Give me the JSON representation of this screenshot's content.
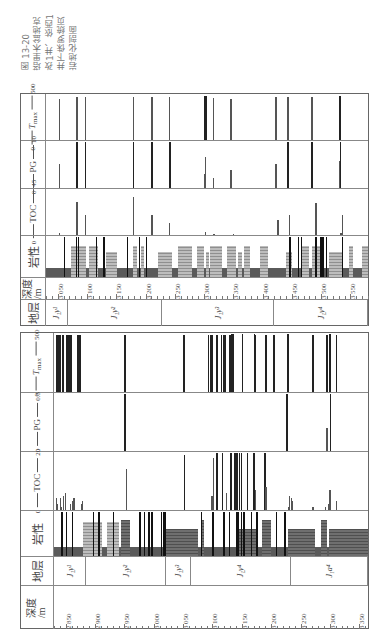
{
  "caption": {
    "lines": [
      "图 13-20",
      "塔里木盆地克",
      "孜1井、依西1",
      "井下侏罗统页",
      "岩地化剖面"
    ]
  },
  "headers": {
    "stratum": "地层",
    "depth": "深度",
    "depth_unit": "/m",
    "lithology": "岩性",
    "toc": "TOC",
    "pg": "PG",
    "tmax": "T",
    "tmax_sub": "max"
  },
  "chart_data": [
    {
      "type": "bar",
      "title": "Well A (upper panel) — Lower Jurassic shale geochemical profile",
      "orientation": "figure rotated 90° CCW; depth axis runs horizontally",
      "xlabel": "深度/m",
      "depth_range": [
        3030,
        3580
      ],
      "depth_ticks": [
        3050,
        3100,
        3150,
        3200,
        3250,
        3300,
        3350,
        3400,
        3450,
        3500,
        3550
      ],
      "strata": [
        {
          "label": "J₁y¹",
          "from": 3030,
          "to": 3067
        },
        {
          "label": "J₁y²",
          "from": 3067,
          "to": 3228
        },
        {
          "label": "J₁y³",
          "from": 3228,
          "to": 3420
        },
        {
          "label": "J₁y⁴",
          "from": 3420,
          "to": 3580
        }
      ],
      "tracks": [
        {
          "name": "TOC",
          "min": 0,
          "max": 45,
          "points": [
            [
              3052,
              2
            ],
            [
              3082,
              32
            ],
            [
              3096,
              20
            ],
            [
              3178,
              37
            ],
            [
              3210,
              20
            ],
            [
              3240,
              12
            ],
            [
              3301,
              3
            ],
            [
              3316,
              1
            ],
            [
              3349,
              1
            ],
            [
              3425,
              15
            ],
            [
              3445,
              20
            ],
            [
              3490,
              31
            ],
            [
              3535,
              20
            ],
            [
              3533,
              2
            ]
          ]
        },
        {
          "name": "PG",
          "min": 0,
          "max": 10,
          "points": [
            [
              3052,
              5.2
            ],
            [
              3082,
              10
            ],
            [
              3096,
              10
            ],
            [
              3178,
              10
            ],
            [
              3210,
              10
            ],
            [
              3240,
              10
            ],
            [
              3300,
              3
            ],
            [
              3301,
              6.5
            ],
            [
              3315,
              2.2
            ],
            [
              3345,
              3.9
            ],
            [
              3422,
              5.1
            ],
            [
              3442,
              10
            ],
            [
              3483,
              10
            ],
            [
              3530,
              5.7
            ],
            [
              3532,
              10
            ]
          ]
        },
        {
          "name": "Tmax",
          "min": 0,
          "max": 500,
          "points": [
            [
              3052,
              450
            ],
            [
              3082,
              470
            ],
            [
              3096,
              465
            ],
            [
              3178,
              470
            ],
            [
              3210,
              470
            ],
            [
              3240,
              470
            ],
            [
              3300,
              480
            ],
            [
              3302,
              480
            ],
            [
              3315,
              460
            ],
            [
              3345,
              450
            ],
            [
              3422,
              470
            ],
            [
              3442,
              470
            ],
            [
              3483,
              470
            ],
            [
              3530,
              480
            ],
            [
              3532,
              480
            ]
          ]
        }
      ],
      "lithology": {
        "base_mudstone": [
          [
            3030,
            3580
          ]
        ],
        "sandstone": [
          [
            3072,
            3098
          ],
          [
            3104,
            3118
          ],
          [
            3133,
            3152
          ],
          [
            3178,
            3185
          ],
          [
            3193,
            3198
          ],
          [
            3222,
            3245
          ],
          [
            3256,
            3280
          ],
          [
            3288,
            3300
          ],
          [
            3303,
            3309
          ],
          [
            3310,
            3330
          ],
          [
            3340,
            3355
          ],
          [
            3358,
            3365
          ],
          [
            3368,
            3378
          ],
          [
            3396,
            3410
          ],
          [
            3440,
            3450
          ],
          [
            3467,
            3480
          ],
          [
            3485,
            3498
          ],
          [
            3513,
            3538
          ],
          [
            3548,
            3555
          ],
          [
            3570,
            3580
          ]
        ],
        "coal": [
          [
            3060
          ],
          [
            3081
          ],
          [
            3084
          ],
          [
            3115
          ],
          [
            3128
          ],
          [
            3168
          ],
          [
            3188
          ],
          [
            3200
          ],
          [
            3445
          ],
          [
            3460
          ],
          [
            3465
          ],
          [
            3490
          ],
          [
            3498
          ],
          [
            3502
          ],
          [
            3508
          ],
          [
            3535
          ]
        ]
      }
    },
    {
      "type": "bar",
      "title": "Well B (lower panel) — Lower Jurassic shale geochemical profile",
      "orientation": "figure rotated 90° CCW; depth axis runs horizontally",
      "xlabel": "深度/m",
      "depth_range": [
        2830,
        3365
      ],
      "depth_ticks": [
        2850,
        2900,
        2950,
        3000,
        3050,
        3100,
        3150,
        3200,
        3250,
        3300,
        3350
      ],
      "strata": [
        {
          "label": "J₁y¹",
          "from": 2830,
          "to": 2885
        },
        {
          "label": "J₁y²",
          "from": 2885,
          "to": 3021
        },
        {
          "label": "J₁y³",
          "from": 3021,
          "to": 3064
        },
        {
          "label": "J₁y⁴",
          "from": 3064,
          "to": 3233
        },
        {
          "label": "J₁a⁴",
          "from": 3233,
          "to": 3365
        }
      ],
      "tracks": [
        {
          "name": "TOC",
          "min": 0,
          "max": 20,
          "points": [
            [
              2833,
              4
            ],
            [
              2835,
              2
            ],
            [
              2840,
              4
            ],
            [
              2842,
              1
            ],
            [
              2845,
              5
            ],
            [
              2848,
              6
            ],
            [
              2857,
              2
            ],
            [
              2860,
              3
            ],
            [
              2862,
              3
            ],
            [
              2863,
              4
            ],
            [
              2876,
              2
            ],
            [
              2878,
              3
            ],
            [
              2952,
              1
            ],
            [
              2953,
              14
            ],
            [
              3051,
              19
            ],
            [
              3098,
              5
            ],
            [
              3101,
              18
            ],
            [
              3106,
              20
            ],
            [
              3116,
              20
            ],
            [
              3123,
              6
            ],
            [
              3130,
              20
            ],
            [
              3137,
              20
            ],
            [
              3140,
              20
            ],
            [
              3145,
              20
            ],
            [
              3148,
              20
            ],
            [
              3158,
              20
            ],
            [
              3169,
              20
            ],
            [
              3172,
              7
            ],
            [
              3188,
              20
            ],
            [
              3190,
              8
            ],
            [
              3229,
              1
            ],
            [
              3230,
              5
            ],
            [
              3234,
              4
            ],
            [
              3235,
              3
            ],
            [
              3270,
              1
            ],
            [
              3292,
              1
            ],
            [
              3296,
              2
            ],
            [
              3299,
              7
            ],
            [
              3310,
              3
            ]
          ]
        },
        {
          "name": "PG",
          "min": 0,
          "max": 0.5,
          "points": [
            [
              2950,
              0.5
            ],
            [
              3226,
              0.5
            ],
            [
              3294,
              0.2
            ],
            [
              3300,
              0.5
            ]
          ]
        },
        {
          "name": "Tmax",
          "min": 0,
          "max": 500,
          "points": [
            [
              2833,
              480
            ],
            [
              2835,
              480
            ],
            [
              2838,
              480
            ],
            [
              2840,
              480
            ],
            [
              2843,
              480
            ],
            [
              2845,
              480
            ],
            [
              2850,
              480
            ],
            [
              2853,
              480
            ],
            [
              2855,
              480
            ],
            [
              2858,
              480
            ],
            [
              2870,
              480
            ],
            [
              2873,
              480
            ],
            [
              2950,
              480
            ],
            [
              3050,
              480
            ],
            [
              3092,
              480
            ],
            [
              3095,
              480
            ],
            [
              3098,
              480
            ],
            [
              3106,
              480
            ],
            [
              3114,
              480
            ],
            [
              3118,
              480
            ],
            [
              3121,
              480
            ],
            [
              3128,
              480
            ],
            [
              3130,
              480
            ],
            [
              3131,
              500
            ],
            [
              3134,
              500
            ],
            [
              3150,
              500
            ],
            [
              3170,
              500
            ],
            [
              3172,
              480
            ],
            [
              3190,
              480
            ],
            [
              3203,
              480
            ],
            [
              3227,
              500
            ],
            [
              3270,
              480
            ],
            [
              3294,
              480
            ],
            [
              3299,
              500
            ],
            [
              3310,
              480
            ]
          ]
        }
      ],
      "lithology": {
        "base_mudstone": [
          [
            2830,
            3365
          ]
        ],
        "sandstone": [
          [
            2880,
            2912
          ],
          [
            2920,
            2940
          ]
        ],
        "mudstone_blocks": [
          [
            2944,
            2960
          ],
          [
            3020,
            3075
          ],
          [
            3080,
            3085
          ],
          [
            3140,
            3175
          ],
          [
            3185,
            3200
          ],
          [
            3228,
            3275
          ],
          [
            3285,
            3295
          ],
          [
            3298,
            3365
          ]
        ],
        "coal": [
          [
            2842
          ],
          [
            2850
          ],
          [
            2860
          ],
          [
            2896
          ],
          [
            2905
          ],
          [
            2930
          ],
          [
            2975
          ],
          [
            2983
          ],
          [
            2990
          ],
          [
            2996
          ],
          [
            3012
          ],
          [
            3015
          ],
          [
            3018
          ],
          [
            3080
          ],
          [
            3100
          ],
          [
            3118
          ],
          [
            3128
          ],
          [
            3140
          ],
          [
            3143
          ],
          [
            3148
          ],
          [
            3152
          ],
          [
            3165
          ],
          [
            3175
          ],
          [
            3208
          ],
          [
            3222
          ]
        ]
      }
    }
  ],
  "panels": {
    "top": {
      "toc_axis": {
        "min": "0",
        "max": "45"
      },
      "pg_axis": {
        "min": "0",
        "max": "10"
      },
      "tmax_axis": {
        "min": "0",
        "max": "500"
      }
    },
    "bottom": {
      "toc_axis": {
        "min": "0",
        "max": "20"
      },
      "pg_axis": {
        "min": "0",
        "max": "0.5"
      },
      "tmax_axis": {
        "min": "0",
        "max": "500"
      }
    }
  }
}
